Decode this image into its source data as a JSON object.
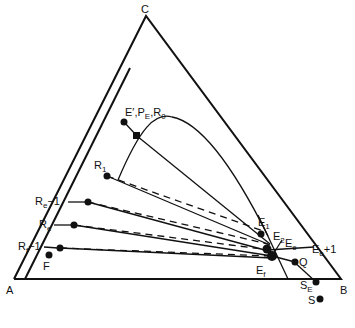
{
  "diagram": {
    "type": "ternary-extraction-diagram",
    "vertices": {
      "top": "C",
      "bottom_left": "A",
      "bottom_right": "B"
    },
    "labels": {
      "E_prime_PE_R0": {
        "main": "E′,P",
        "sub": "E",
        "sep": ",R",
        "sub2": "0"
      },
      "R1": {
        "main": "R",
        "sub": "1"
      },
      "Re_minus_1": {
        "main": "R",
        "sub": "e",
        "tail": "−1"
      },
      "Re": {
        "main": "R",
        "sub": "e"
      },
      "Rf_minus_1": {
        "main": "R",
        "sub": "f",
        "tail": "−1"
      },
      "F": {
        "main": "F"
      },
      "E1": {
        "main": "E",
        "sub": "1"
      },
      "E2": {
        "main": "E",
        "sub": "2"
      },
      "Ee": {
        "main": "E",
        "sub": "e"
      },
      "Ee_plus_1": {
        "main": "E",
        "sub": "e",
        "tail": "+1"
      },
      "Ef": {
        "main": "E",
        "sub": "f"
      },
      "Q": {
        "main": "Q"
      },
      "SE": {
        "main": "S",
        "sub": "E"
      },
      "S": {
        "main": "S"
      }
    },
    "line_styles": {
      "operating_lines": "solid",
      "tie_lines": "dashed"
    },
    "ink_color": "#111111",
    "background": "#ffffff"
  }
}
